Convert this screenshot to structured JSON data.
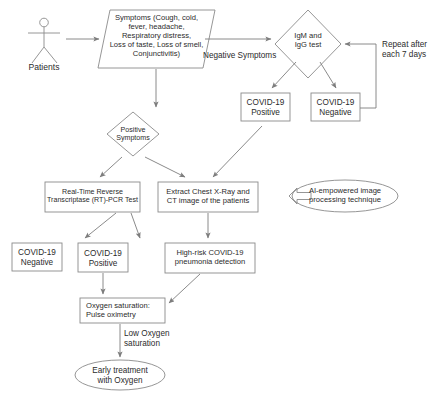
{
  "diagram": {
    "stroke_color": "#8a8a8a",
    "text_color": "#2b2b2b",
    "background_color": "#ffffff",
    "actor": {
      "label": "Patients",
      "icon": "stick-figure-person-icon"
    },
    "nodes": [
      {
        "id": "symptoms",
        "shape": "parallelogram",
        "text": "Symptoms (Cough, cold,\nfever, headache,\nRespiratory distress,\nLoss of taste, Loss of smell,\nConjunctivitis)"
      },
      {
        "id": "igm-igg-test",
        "shape": "diamond",
        "text": "IgM and\nIgG test"
      },
      {
        "id": "serology-positive",
        "shape": "rectangle",
        "text": "COVID-19\nPositive"
      },
      {
        "id": "serology-negative",
        "shape": "rectangle",
        "text": "COVID-19\nNegative"
      },
      {
        "id": "positive-symptoms",
        "shape": "diamond",
        "text": "Positive\nSymptoms"
      },
      {
        "id": "rtpcr-test",
        "shape": "rectangle",
        "text": "Real-Time Reverse\nTranscriptase (RT)-PCR Test"
      },
      {
        "id": "extract-imaging",
        "shape": "rectangle",
        "text": "Extract Chest X-Ray and\nCT image of the patients"
      },
      {
        "id": "ai-technique",
        "shape": "ellipse",
        "text": "AI-empowered image\nprocessing technique"
      },
      {
        "id": "pcr-negative",
        "shape": "rectangle",
        "text": "COVID-19\nNegative"
      },
      {
        "id": "pcr-positive",
        "shape": "rectangle",
        "text": "COVID-19\nPositive"
      },
      {
        "id": "pneumonia-detection",
        "shape": "rectangle",
        "text": "High-risk COVID-19\npneumonia detection"
      },
      {
        "id": "oxygen-saturation",
        "shape": "rectangle",
        "text": "Oxygen saturation:\nPulse oximetry"
      },
      {
        "id": "early-treatment",
        "shape": "ellipse",
        "text": "Early treatment\nwith Oxygen"
      }
    ],
    "edge_labels": {
      "negative_symptoms": "Negative Symptoms",
      "repeat_interval": "Repeat after\neach 7 days",
      "low_oxygen": "Low Oxygen\nsaturation"
    }
  }
}
